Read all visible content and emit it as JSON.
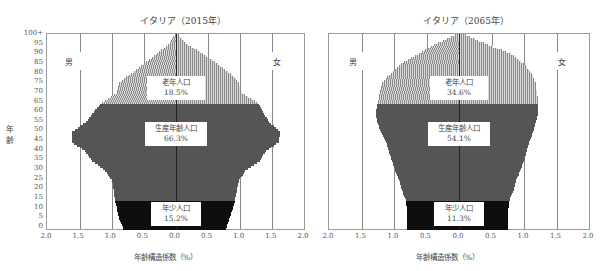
{
  "chart_data": [
    {
      "type": "bar",
      "subtype": "population-pyramid",
      "title": "イタリア（2015年）",
      "xlabel": "年齢構造係数（%）",
      "ylabel": "年齢",
      "x_ticks": [
        "2.0",
        "1.5",
        "1.0",
        "0.5",
        "0.0",
        "0.5",
        "1.0",
        "1.5",
        "2.0"
      ],
      "y_ticks": [
        "0",
        "5",
        "10",
        "15",
        "20",
        "25",
        "30",
        "35",
        "40",
        "45",
        "50",
        "55",
        "60",
        "65",
        "70",
        "75",
        "80",
        "85",
        "90",
        "95",
        "100+"
      ],
      "xlim": [
        -2.0,
        2.0
      ],
      "ylim": [
        0,
        100
      ],
      "legend_left": "男",
      "legend_right": "女",
      "segments": [
        {
          "name": "老年人口",
          "value": "18.5%",
          "age_range": [
            65,
            100
          ]
        },
        {
          "name": "生産年齢人口",
          "value": "66.3%",
          "age_range": [
            15,
            64
          ]
        },
        {
          "name": "年少人口",
          "value": "15.2%",
          "age_range": [
            0,
            14
          ]
        }
      ],
      "ages": [
        0,
        5,
        10,
        15,
        20,
        25,
        30,
        35,
        40,
        45,
        50,
        55,
        60,
        65,
        70,
        75,
        80,
        85,
        90,
        95,
        100
      ],
      "male": [
        0.82,
        0.88,
        0.92,
        0.95,
        0.97,
        1.0,
        1.1,
        1.3,
        1.42,
        1.62,
        1.62,
        1.4,
        1.28,
        1.15,
        0.92,
        0.88,
        0.7,
        0.5,
        0.3,
        0.12,
        0.02
      ],
      "female": [
        0.78,
        0.83,
        0.88,
        0.92,
        0.95,
        0.98,
        1.08,
        1.3,
        1.4,
        1.6,
        1.62,
        1.45,
        1.35,
        1.28,
        1.02,
        0.98,
        0.85,
        0.65,
        0.42,
        0.18,
        0.04
      ]
    },
    {
      "type": "bar",
      "subtype": "population-pyramid",
      "title": "イタリア（2065年）",
      "xlabel": "年齢構造係数（%）",
      "ylabel": "年齢",
      "x_ticks": [
        "2.0",
        "1.5",
        "1.0",
        "0.5",
        "0.0",
        "0.5",
        "1.0",
        "1.5",
        "2.0"
      ],
      "y_ticks": [
        "0",
        "5",
        "10",
        "15",
        "20",
        "25",
        "30",
        "35",
        "40",
        "45",
        "50",
        "55",
        "60",
        "65",
        "70",
        "75",
        "80",
        "85",
        "90",
        "95",
        "100+"
      ],
      "xlim": [
        -2.0,
        2.0
      ],
      "ylim": [
        0,
        100
      ],
      "legend_left": "男",
      "legend_right": "女",
      "segments": [
        {
          "name": "老年人口",
          "value": "34.6%",
          "age_range": [
            65,
            100
          ]
        },
        {
          "name": "生産年齢人口",
          "value": "54.1%",
          "age_range": [
            15,
            64
          ]
        },
        {
          "name": "年少人口",
          "value": "11.3%",
          "age_range": [
            0,
            14
          ]
        }
      ],
      "ages": [
        0,
        5,
        10,
        15,
        20,
        25,
        30,
        35,
        40,
        45,
        50,
        55,
        60,
        65,
        70,
        75,
        80,
        85,
        90,
        95,
        100
      ],
      "male": [
        0.8,
        0.8,
        0.8,
        0.82,
        0.88,
        0.92,
        0.98,
        1.03,
        1.08,
        1.12,
        1.2,
        1.26,
        1.28,
        1.25,
        1.22,
        1.18,
        1.05,
        0.9,
        0.62,
        0.38,
        0.06
      ],
      "female": [
        0.76,
        0.76,
        0.76,
        0.78,
        0.84,
        0.88,
        0.94,
        1.0,
        1.04,
        1.08,
        1.14,
        1.18,
        1.22,
        1.22,
        1.2,
        1.18,
        1.12,
        1.0,
        0.8,
        0.45,
        0.1
      ]
    }
  ],
  "charts": [
    {
      "title": "イタリア（2015年）",
      "male_label": "男",
      "female_label": "女",
      "old": {
        "name": "老年人口",
        "value": "18.5%"
      },
      "work": {
        "name": "生産年齢人口",
        "value": "66.3%"
      },
      "young": {
        "name": "年少人口",
        "value": "15.2%"
      },
      "xlabel": "年齢構造係数（%）"
    },
    {
      "title": "イタリア（2065年）",
      "male_label": "男",
      "female_label": "女",
      "old": {
        "name": "老年人口",
        "value": "34.6%"
      },
      "work": {
        "name": "生産年齢人口",
        "value": "54.1%"
      },
      "young": {
        "name": "年少人口",
        "value": "11.3%"
      },
      "xlabel": "年齢構造係数（%）"
    }
  ],
  "shared": {
    "ylabel_top": "年",
    "ylabel_bottom": "齢",
    "x_ticks": [
      "2.0",
      "1.5",
      "1.0",
      "0.5",
      "0.0",
      "0.5",
      "1.0",
      "1.5",
      "2.0"
    ],
    "y_ticks": [
      "0",
      "5",
      "10",
      "15",
      "20",
      "25",
      "30",
      "35",
      "40",
      "45",
      "50",
      "55",
      "60",
      "65",
      "70",
      "75",
      "80",
      "85",
      "90",
      "95",
      "100+"
    ]
  }
}
